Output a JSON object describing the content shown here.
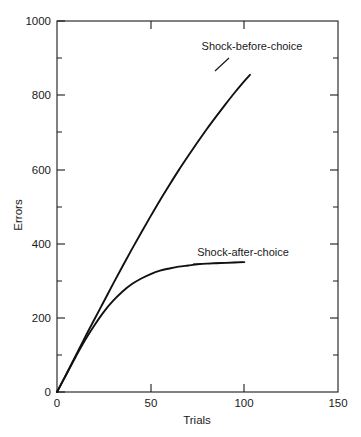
{
  "chart_data": {
    "type": "line",
    "title": "",
    "xlabel": "Trials",
    "ylabel": "Errors",
    "xlim": [
      0,
      150
    ],
    "ylim": [
      0,
      1000
    ],
    "grid": false,
    "legend_position": "inline-annotations",
    "x_ticks_major": [
      0,
      50,
      100,
      150
    ],
    "x_tick_labels": [
      "0",
      "50",
      "100",
      "150"
    ],
    "y_ticks_major": [
      0,
      200,
      400,
      600,
      800,
      1000
    ],
    "y_tick_labels": [
      "0",
      "200",
      "400",
      "600",
      "800",
      "1000"
    ],
    "y_ticks_minor": [
      100,
      300,
      500,
      700,
      900
    ],
    "origin_label": "0",
    "series": [
      {
        "name": "Shock-before-choice",
        "x": [
          0,
          5,
          10,
          15,
          20,
          25,
          30,
          35,
          40,
          45,
          50,
          55,
          60,
          65,
          70,
          75,
          80,
          85,
          90,
          95,
          100,
          103
        ],
        "values": [
          0,
          48,
          98,
          148,
          196,
          244,
          292,
          339,
          385,
          430,
          474,
          517,
          558,
          598,
          636,
          673,
          709,
          743,
          776,
          808,
          838,
          855
        ]
      },
      {
        "name": "Shock-after-choice",
        "x": [
          0,
          5,
          10,
          15,
          20,
          25,
          30,
          35,
          40,
          45,
          50,
          55,
          60,
          65,
          70,
          75,
          80,
          85,
          90,
          95,
          100
        ],
        "values": [
          0,
          48,
          95,
          140,
          180,
          216,
          246,
          271,
          291,
          306,
          318,
          327,
          333,
          338,
          341,
          344,
          346,
          347,
          348,
          349,
          350
        ]
      }
    ],
    "annotations": [
      {
        "text": "Shock-before-choice",
        "x_px": 252,
        "y_px": 50,
        "leader_from_x_px": 229,
        "leader_from_y_px": 58,
        "leader_to_x_px": 215,
        "leader_to_y_px": 71
      },
      {
        "text": "Shock-after-choice",
        "x_px": 243,
        "y_px": 256,
        "leader_from_x_px": 243,
        "leader_from_y_px": 262,
        "leader_to_x_px": 193,
        "leader_to_y_px": 264
      }
    ]
  },
  "plot_geometry": {
    "left_px": 57,
    "right_px": 338,
    "top_px": 21,
    "bottom_px": 392
  }
}
